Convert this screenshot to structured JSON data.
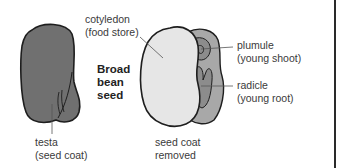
{
  "title": {
    "line1": "Broad",
    "line2": "bean",
    "line3": "seed"
  },
  "labels": {
    "cotyledon": {
      "line1": "cotyledon",
      "line2": "(food store)"
    },
    "plumule": {
      "line1": "plumule",
      "line2": "(young shoot)"
    },
    "radicle": {
      "line1": "radicle",
      "line2": "(young root)"
    },
    "testa": {
      "line1": "testa",
      "line2": "(seed coat)"
    },
    "seed_coat_removed": {
      "line1": "seed coat",
      "line2": "removed"
    }
  },
  "colors": {
    "testa_fill": "#707070",
    "cotyledon_fill": "#e6e6e6",
    "inner_fill": "#a8a8a8",
    "embryo_fill": "#8c8c8c",
    "outline": "#1e1e1e",
    "leader_line": "#555555"
  }
}
